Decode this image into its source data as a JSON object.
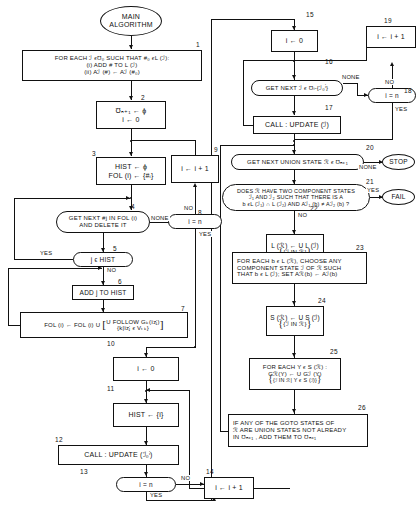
{
  "diagram": {
    "title": "MAIN ALGORITHM",
    "type": "flowchart",
    "edge_labels": {
      "none": "NONE",
      "yes": "YES",
      "no": "NO",
      "stop": "STOP",
      "fail": "FAIL"
    }
  },
  "nodes": {
    "start": {
      "num": "",
      "shape": "terminator",
      "line1": "MAIN",
      "line2": "ALGORITHM"
    },
    "n1": {
      "num": "1",
      "shape": "process",
      "line1": "FOR EACH ℐ ϵƱ₀ SUCH THAT #₀ ϵL (ℐ):",
      "line2": "(i) ADD # TO L (ℐ)",
      "line3": "(ii) Aℐ (#) ← Aℐ (#₀)"
    },
    "n2": {
      "num": "2",
      "shape": "process",
      "line1": "Ʊₙ₊₁ ← ϕ",
      "line2": "i ← 0"
    },
    "n3": {
      "num": "3",
      "shape": "process",
      "line1": "HIST ← ϕ",
      "line2": "FOL (i) ← {#ᵢ}"
    },
    "n4": {
      "num": "4",
      "shape": "capsule",
      "line1": "GET NEXT #j IN FOL (i)",
      "line2": "AND DELETE IT"
    },
    "n5": {
      "num": "5",
      "shape": "capsule",
      "line1": "j ϵ HIST"
    },
    "n6": {
      "num": "6",
      "shape": "process",
      "line1": "ADD j TO HIST"
    },
    "n7": {
      "num": "7",
      "shape": "process",
      "lhs": "FOL (i) ← FOL (i) U",
      "frac_top": "U FOLLOW Gₖ(ïzⱼ)",
      "frac_bot": "{k|ïzⱼ ϵ Vₜₖ}"
    },
    "n8": {
      "num": "8",
      "shape": "capsule",
      "line1": "i = n"
    },
    "n9": {
      "num": "9",
      "shape": "process",
      "line1": "i ← i + 1"
    },
    "n10": {
      "num": "10",
      "shape": "process",
      "line1": "i ← 0"
    },
    "n11": {
      "num": "11",
      "shape": "process",
      "line1": "HIST ← {i}"
    },
    "n12": {
      "num": "12",
      "shape": "process",
      "line1": "CALL : UPDATE (ℐ₀ⁱ)"
    },
    "n13": {
      "num": "13",
      "shape": "capsule",
      "line1": "i = n"
    },
    "n14": {
      "num": "14",
      "shape": "process",
      "line1": "i ← i + 1"
    },
    "n15": {
      "num": "15",
      "shape": "process",
      "line1": "i ← 0"
    },
    "n16": {
      "num": "16",
      "shape": "capsule",
      "line1": "GET NEXT ℐ ϵ Ʊᵢ-{ℐ₀ⁱ}"
    },
    "n17": {
      "num": "17",
      "shape": "process",
      "line1": "CALL : UPDATE (ℐ)"
    },
    "n18": {
      "num": "18",
      "shape": "capsule",
      "line1": "i = n"
    },
    "n19": {
      "num": "19",
      "shape": "process",
      "line1": "i ← i + 1"
    },
    "n20": {
      "num": "20",
      "shape": "capsule",
      "line1": "GET NEXT UNION STATE ℛ ϵ Ʊₙ₊₁"
    },
    "n21": {
      "num": "21",
      "shape": "capsule",
      "line1": "DOES ℛ HAVE TWO COMPONENT STATES",
      "line2": "ℐ₁ AND ℐ₂ SUCH THAT THERE IS A",
      "line3": "b ϵL (ℐ₁) ∩ L (ℐ₂) AND Aℐ₁ (b) ≠ Aℐ₂ (b) ?"
    },
    "n22": {
      "num": "22",
      "shape": "process",
      "line1": "L (ℛ) ← U L (ℐ)",
      "line2": "{ℐ IN ℛ}"
    },
    "n23": {
      "num": "23",
      "shape": "process",
      "line1": "FOR EACH b ϵ L (ℛ), CHOOSE ANY",
      "line2": "COMPONENT STATE ℐ OF ℛ SUCH",
      "line3": "THAT b ϵ L (ℐ); SET Aℛ(b) ← Aℐ(b)"
    },
    "n24": {
      "num": "24",
      "shape": "process",
      "line1": "S (ℛ) ← U S (ℐ)",
      "line2": "{ℐ IN ℛ}"
    },
    "n25": {
      "num": "25",
      "shape": "process",
      "line1": "FOR EACH Y ϵ S (ℛ) :",
      "line2": "Gℛ(Y) ← U    Gℐ (Y)",
      "line3": "{ℐ IN ℛ| Y ϵ S (ℐ)}"
    },
    "n26": {
      "num": "26",
      "shape": "process",
      "line1": "IF ANY OF THE GOTO  STATES OF",
      "line2": "ℛ ARE UNION STATES NOT ALREADY",
      "line3": "IN Ʊₙ₊₁ , ADD THEM TO Ʊₙ₊₁"
    },
    "stop": {
      "num": "",
      "shape": "terminator",
      "line1": "STOP"
    },
    "fail": {
      "num": "",
      "shape": "terminator",
      "line1": "FAIL"
    }
  }
}
